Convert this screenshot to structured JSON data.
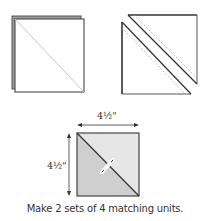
{
  "diagram": {
    "step1": {
      "description": "Two stacked squares with drawn diagonal line"
    },
    "step2": {
      "description": "Stacked squares sewn 1/4 inch on each side of diagonal, cut apart"
    },
    "result": {
      "width_label": "4½\"",
      "height_label": "4½\"",
      "description": "Half-square triangle unit with pressing arrow"
    },
    "caption": "Make 2 sets of 4 matching units.",
    "colors": {
      "outline": "#555555",
      "light_fabric": "#e6e6e6",
      "dark_fabric": "#cfcfcf",
      "shadow": "#8a8a8a"
    }
  }
}
